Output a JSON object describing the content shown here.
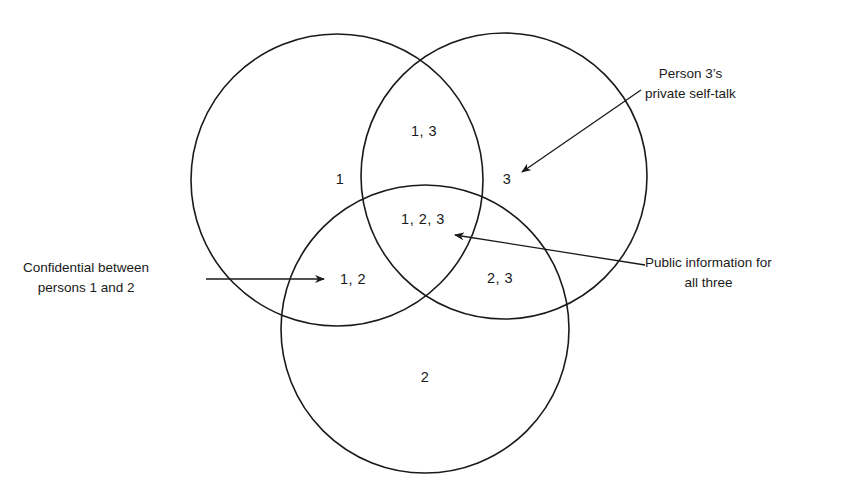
{
  "diagram": {
    "type": "venn",
    "sets": [
      {
        "id": "1",
        "label": "1",
        "cx": 337,
        "cy": 180,
        "r": 146
      },
      {
        "id": "2",
        "label": "2",
        "cx": 425,
        "cy": 329,
        "r": 144
      },
      {
        "id": "3",
        "label": "3",
        "cx": 504,
        "cy": 176,
        "r": 143
      }
    ],
    "regions": {
      "only_1": "1",
      "only_2": "2",
      "only_3": "3",
      "r_1_3": "1, 3",
      "r_1_2": "1, 2",
      "r_2_3": "2, 3",
      "r_1_2_3": "1, 2, 3"
    },
    "callouts": {
      "self_talk": {
        "line1": "Person 3’s",
        "line2": "private self-talk",
        "points_to": "3"
      },
      "confidential": {
        "line1": "Confidential between",
        "line2": "persons 1 and 2",
        "points_to": "1, 2"
      },
      "public": {
        "line1": "Public information for",
        "line2": "all three",
        "points_to": "1, 2, 3"
      }
    },
    "stroke_color": "#1a1a1a",
    "background": "#ffffff"
  }
}
